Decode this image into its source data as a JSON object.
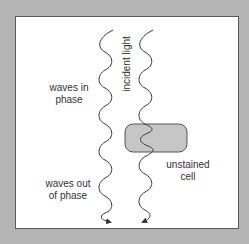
{
  "diagram": {
    "labels": {
      "waves_in_phase_line1": "waves in",
      "waves_in_phase_line2": "phase",
      "incident_light": "incident light",
      "unstained_cell_line1": "unstained",
      "unstained_cell_line2": "cell",
      "waves_out_of_phase_line1": "waves out",
      "waves_out_of_phase_line2": "of phase"
    },
    "colors": {
      "background": "#b4b4b4",
      "panel": "#ffffff",
      "wave_stroke": "#333333",
      "cell_fill": "#c6c6c6",
      "cell_stroke": "#555555"
    },
    "elements": {
      "left_wave": "light wave passing through medium only",
      "right_wave": "light wave passing through unstained cell",
      "cell": "unstained cell (phase-shifting object)"
    }
  }
}
